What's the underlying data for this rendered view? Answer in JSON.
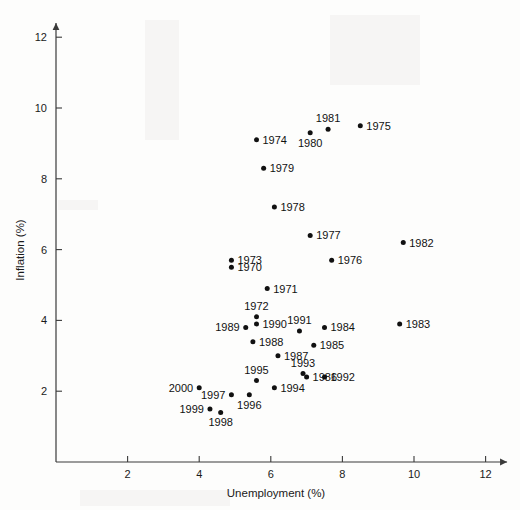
{
  "chart_data": {
    "type": "scatter",
    "title": "",
    "xlabel": "Unemployment (%)",
    "ylabel": "Inflation (%)",
    "xlim": [
      0,
      12.6
    ],
    "ylim": [
      0,
      12.4
    ],
    "xticks": [
      2,
      4,
      6,
      8,
      10,
      12
    ],
    "yticks": [
      2,
      4,
      6,
      8,
      10,
      12
    ],
    "grid": false,
    "legend": null,
    "point_label_field": "year",
    "points": [
      {
        "year": "1970",
        "x": 4.9,
        "y": 5.5,
        "label_side": "right"
      },
      {
        "year": "1971",
        "x": 5.9,
        "y": 4.9,
        "label_side": "right"
      },
      {
        "year": "1972",
        "x": 5.6,
        "y": 4.1,
        "label_side": "above"
      },
      {
        "year": "1973",
        "x": 4.9,
        "y": 5.7,
        "label_side": "right"
      },
      {
        "year": "1974",
        "x": 5.6,
        "y": 9.1,
        "label_side": "right"
      },
      {
        "year": "1975",
        "x": 8.5,
        "y": 9.5,
        "label_side": "right"
      },
      {
        "year": "1976",
        "x": 7.7,
        "y": 5.7,
        "label_side": "right"
      },
      {
        "year": "1977",
        "x": 7.1,
        "y": 6.4,
        "label_side": "right"
      },
      {
        "year": "1978",
        "x": 6.1,
        "y": 7.2,
        "label_side": "right"
      },
      {
        "year": "1979",
        "x": 5.8,
        "y": 8.3,
        "label_side": "right"
      },
      {
        "year": "1980",
        "x": 7.1,
        "y": 9.3,
        "label_side": "below"
      },
      {
        "year": "1981",
        "x": 7.6,
        "y": 9.4,
        "label_side": "above"
      },
      {
        "year": "1982",
        "x": 9.7,
        "y": 6.2,
        "label_side": "right"
      },
      {
        "year": "1983",
        "x": 9.6,
        "y": 3.9,
        "label_side": "right"
      },
      {
        "year": "1984",
        "x": 7.5,
        "y": 3.8,
        "label_side": "right"
      },
      {
        "year": "1985",
        "x": 7.2,
        "y": 3.3,
        "label_side": "right"
      },
      {
        "year": "1986",
        "x": 7.0,
        "y": 2.4,
        "label_side": "right"
      },
      {
        "year": "1987",
        "x": 6.2,
        "y": 3.0,
        "label_side": "right"
      },
      {
        "year": "1988",
        "x": 5.5,
        "y": 3.4,
        "label_side": "right"
      },
      {
        "year": "1989",
        "x": 5.3,
        "y": 3.8,
        "label_side": "left"
      },
      {
        "year": "1990",
        "x": 5.6,
        "y": 3.9,
        "label_side": "right"
      },
      {
        "year": "1991",
        "x": 6.8,
        "y": 3.7,
        "label_side": "above"
      },
      {
        "year": "1992",
        "x": 7.5,
        "y": 2.4,
        "label_side": "right"
      },
      {
        "year": "1993",
        "x": 6.9,
        "y": 2.5,
        "label_side": "above"
      },
      {
        "year": "1994",
        "x": 6.1,
        "y": 2.1,
        "label_side": "right"
      },
      {
        "year": "1995",
        "x": 5.6,
        "y": 2.3,
        "label_side": "above"
      },
      {
        "year": "1996",
        "x": 5.4,
        "y": 1.9,
        "label_side": "below"
      },
      {
        "year": "1997",
        "x": 4.9,
        "y": 1.9,
        "label_side": "left"
      },
      {
        "year": "1998",
        "x": 4.6,
        "y": 1.4,
        "label_side": "below"
      },
      {
        "year": "1999",
        "x": 4.3,
        "y": 1.5,
        "label_side": "left"
      },
      {
        "year": "2000",
        "x": 4.0,
        "y": 2.1,
        "label_side": "left"
      }
    ]
  }
}
